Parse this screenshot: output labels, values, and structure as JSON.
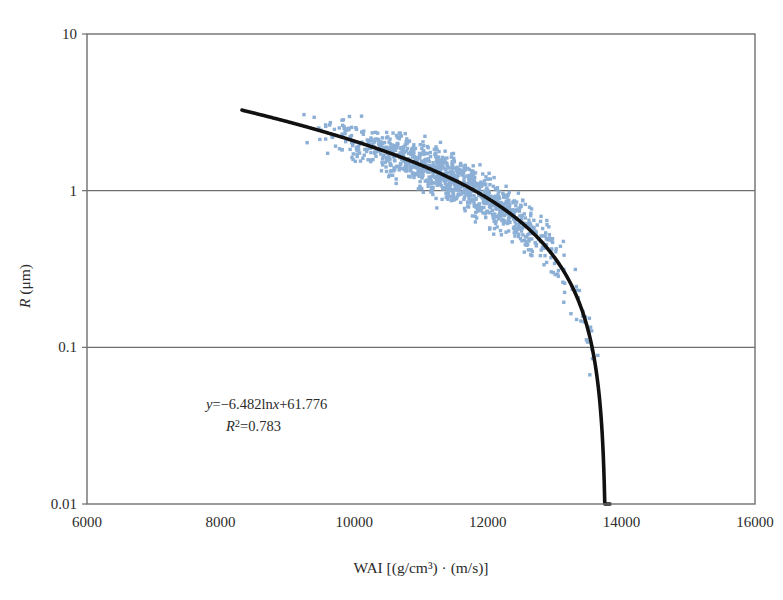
{
  "chart_data": {
    "type": "scatter",
    "title": "",
    "xlabel": "WAI  [(g/cm³) · (m/s)]",
    "ylabel": "R  (μm)",
    "ylabel_italic_part": "R",
    "ylabel_rest": "  (μm)",
    "xlim": [
      6000,
      16000
    ],
    "ylim": [
      0.01,
      10
    ],
    "yscale": "log",
    "xscale": "linear",
    "grid": "horizontal-major-only",
    "legend": "none",
    "xticks": [
      6000,
      8000,
      10000,
      12000,
      14000,
      16000
    ],
    "xtick_labels": [
      "6000",
      "8000",
      "10000",
      "12000",
      "14000",
      "16000"
    ],
    "yticks": [
      10,
      1,
      0.1,
      0.01
    ],
    "ytick_labels": [
      "10",
      "1",
      "0.1",
      "0.01"
    ],
    "annotations": {
      "equation_line1_parts": {
        "y": "y",
        "rest": "=−6.482ln",
        "x": "x",
        "tail": "+61.776"
      },
      "equation_line1": "y=−6.482lnx+61.776",
      "equation_line2_parts": {
        "r": "R",
        "sup": "2",
        "rest": "=0.783"
      },
      "equation_line2": "R²=0.783",
      "equation_x_data": 9150,
      "equation_y1_data": 0.235,
      "equation_y2_data": 0.16
    },
    "fit": {
      "model": "logarithmic",
      "expression": "y = -6.482*ln(x) + 61.776",
      "slope": -6.482,
      "intercept": 61.776,
      "r_squared": 0.783,
      "x_start": 8320,
      "x_end": 13830,
      "note": "fit curve plotted on log-y axis, drops steeply near x=13830"
    },
    "series": [
      {
        "name": "measured R vs WAI",
        "marker": "square",
        "marker_size_px": 3.4,
        "color": "#8cafd6",
        "n_points": 1100,
        "x_range": [
          8350,
          14050
        ],
        "y_range": [
          0.055,
          4.3
        ],
        "description": "dense blue scatter cloud following the logarithmic fit with vertical spread of roughly a factor of 2"
      }
    ],
    "colors": {
      "points": "#8cafd6",
      "fit_line": "#111111",
      "axis": "#6f6f6f",
      "text": "#2b2b2b",
      "background": "#ffffff"
    }
  },
  "figure": {
    "plot_area": {
      "left": 87,
      "top": 34,
      "right": 755,
      "bottom": 504
    }
  }
}
